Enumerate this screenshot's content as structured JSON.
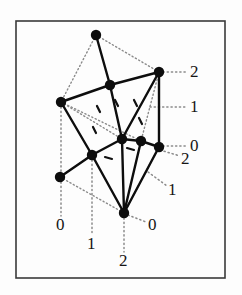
{
  "figure": {
    "type": "lattice-polytope-diagram",
    "background_color": "#fdfdfd",
    "frame_color": "#3a3a3a",
    "node_color": "#0d0d0d",
    "solid_edge_color": "#0d0d0d",
    "dotted_edge_color": "#8a8a8a",
    "frame": {
      "x": 16,
      "y": 21,
      "width": 209,
      "height": 257
    },
    "nodes": [
      {
        "name": "node-top",
        "x": 96,
        "y": 35,
        "r": 5.2
      },
      {
        "name": "node-upper-right",
        "x": 159,
        "y": 72,
        "r": 5.2
      },
      {
        "name": "node-upper-mid",
        "x": 110,
        "y": 85,
        "r": 5.2
      },
      {
        "name": "node-left-upper",
        "x": 61,
        "y": 102,
        "r": 5.2
      },
      {
        "name": "node-center",
        "x": 122,
        "y": 139,
        "r": 5.2
      },
      {
        "name": "node-center-right",
        "x": 141,
        "y": 141,
        "r": 5.2
      },
      {
        "name": "node-right-lower",
        "x": 159,
        "y": 147,
        "r": 5.2
      },
      {
        "name": "node-mid-left",
        "x": 92,
        "y": 155,
        "r": 5.2
      },
      {
        "name": "node-left-lower",
        "x": 60,
        "y": 177,
        "r": 5.2
      },
      {
        "name": "node-bottom",
        "x": 124,
        "y": 213,
        "r": 5.2
      }
    ],
    "solid_edges": [
      [
        "node-top",
        "node-upper-mid"
      ],
      [
        "node-upper-mid",
        "node-upper-right"
      ],
      [
        "node-upper-mid",
        "node-left-upper"
      ],
      [
        "node-upper-mid",
        "node-center"
      ],
      [
        "node-upper-right",
        "node-center"
      ],
      [
        "node-upper-right",
        "node-right-lower"
      ],
      [
        "node-left-upper",
        "node-mid-left"
      ],
      [
        "node-center",
        "node-center-right"
      ],
      [
        "node-center-right",
        "node-right-lower"
      ],
      [
        "node-center",
        "node-mid-left"
      ],
      [
        "node-center",
        "node-bottom"
      ],
      [
        "node-mid-left",
        "node-left-lower"
      ],
      [
        "node-mid-left",
        "node-bottom"
      ],
      [
        "node-right-lower",
        "node-bottom"
      ],
      [
        "node-center-right",
        "node-bottom"
      ]
    ],
    "dotted_edges": [
      [
        "node-top",
        "node-left-upper"
      ],
      [
        "node-top",
        "node-upper-right"
      ],
      [
        "node-left-upper",
        "node-center"
      ],
      [
        "node-left-upper",
        "node-center-right"
      ],
      [
        "node-upper-right",
        "node-center-right"
      ],
      [
        "node-left-lower",
        "node-bottom"
      ],
      [
        "node-left-lower",
        "node-mid-left"
      ],
      [
        "node-bottom",
        "node-right-lower"
      ]
    ],
    "dotted_leader_lines": [
      {
        "name": "leader-right-2",
        "x1": 163,
        "y1": 72,
        "x2": 186,
        "y2": 72
      },
      {
        "name": "leader-right-1",
        "x1": 150,
        "y1": 107,
        "x2": 186,
        "y2": 107
      },
      {
        "name": "leader-right-0",
        "x1": 163,
        "y1": 146,
        "x2": 186,
        "y2": 146
      },
      {
        "name": "leader-diag-2",
        "x1": 160,
        "y1": 150,
        "x2": 180,
        "y2": 156
      },
      {
        "name": "leader-diag-1",
        "x1": 148,
        "y1": 172,
        "x2": 167,
        "y2": 186
      },
      {
        "name": "leader-diag-0",
        "x1": 128,
        "y1": 215,
        "x2": 146,
        "y2": 222
      },
      {
        "name": "leader-bottom-0",
        "x1": 61,
        "y1": 182,
        "x2": 61,
        "y2": 216
      },
      {
        "name": "leader-bottom-1",
        "x1": 92,
        "y1": 160,
        "x2": 92,
        "y2": 235
      },
      {
        "name": "leader-bottom-2",
        "x1": 124,
        "y1": 218,
        "x2": 124,
        "y2": 252
      },
      {
        "name": "leader-vert-left-upper",
        "x1": 61,
        "y1": 107,
        "x2": 61,
        "y2": 172
      },
      {
        "name": "leader-vert-right",
        "x1": 159,
        "y1": 77,
        "x2": 159,
        "y2": 142
      }
    ],
    "tick_marks": [
      {
        "name": "tick-a",
        "x1": 97,
        "y1": 106,
        "x2": 100,
        "y2": 112
      },
      {
        "name": "tick-b",
        "x1": 115,
        "y1": 100,
        "x2": 118,
        "y2": 106
      },
      {
        "name": "tick-c",
        "x1": 134,
        "y1": 100,
        "x2": 137,
        "y2": 106
      },
      {
        "name": "tick-d",
        "x1": 93,
        "y1": 127,
        "x2": 96,
        "y2": 133
      },
      {
        "name": "tick-e",
        "x1": 139,
        "y1": 118,
        "x2": 142,
        "y2": 124
      },
      {
        "name": "tick-f",
        "x1": 105,
        "y1": 157,
        "x2": 112,
        "y2": 159
      },
      {
        "name": "tick-g",
        "x1": 127,
        "y1": 148,
        "x2": 134,
        "y2": 150
      }
    ],
    "labels": [
      {
        "name": "label-right-2",
        "text": "2",
        "x": 190,
        "y": 63
      },
      {
        "name": "label-right-1",
        "text": "1",
        "x": 190,
        "y": 98
      },
      {
        "name": "label-right-0",
        "text": "0",
        "x": 190,
        "y": 137
      },
      {
        "name": "label-diag-2",
        "text": "2",
        "x": 181,
        "y": 150
      },
      {
        "name": "label-diag-1",
        "text": "1",
        "x": 168,
        "y": 181
      },
      {
        "name": "label-diag-0",
        "text": "0",
        "x": 148,
        "y": 216
      },
      {
        "name": "label-bottom-0",
        "text": "0",
        "x": 56,
        "y": 216
      },
      {
        "name": "label-bottom-1",
        "text": "1",
        "x": 87,
        "y": 235
      },
      {
        "name": "label-bottom-2",
        "text": "2",
        "x": 119,
        "y": 252
      }
    ]
  }
}
